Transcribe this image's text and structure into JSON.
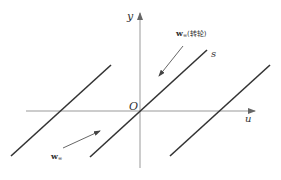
{
  "diagram": {
    "axes": {
      "x_label": "u",
      "y_label": "y",
      "origin_label": "O"
    },
    "lines": [
      {
        "name": "left-line",
        "x1": 11,
        "y1": 156,
        "x2": 111,
        "y2": 65
      },
      {
        "name": "middle-line-s",
        "x1": 90,
        "y1": 157,
        "x2": 207,
        "y2": 50,
        "label": "s"
      },
      {
        "name": "right-line",
        "x1": 170,
        "y1": 156,
        "x2": 270,
        "y2": 65
      }
    ],
    "vectors": [
      {
        "name": "w-infinity-runner",
        "label_main": "w",
        "label_sub": "∞",
        "label_suffix": "(转轮)"
      },
      {
        "name": "w-infinity",
        "label_main": "w",
        "label_sub": "∞"
      }
    ],
    "colors": {
      "axis": "#999999",
      "line": "#333333",
      "arrow": "#555555"
    }
  }
}
